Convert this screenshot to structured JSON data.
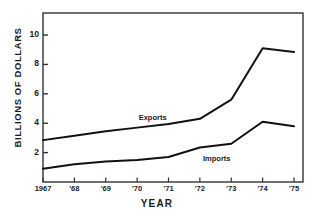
{
  "chart_data": {
    "type": "line",
    "title": "",
    "xlabel": "YEAR",
    "ylabel": "BILLIONS OF DOLLARS",
    "categories": [
      "1967",
      "'68",
      "'69",
      "'70",
      "'71",
      "'72",
      "'73",
      "'74",
      "'75"
    ],
    "x": [
      1967,
      1968,
      1969,
      1970,
      1971,
      1972,
      1973,
      1974,
      1975
    ],
    "xlim": [
      1967,
      1975
    ],
    "ylim": [
      0,
      11.5
    ],
    "yticks": [
      2,
      4,
      6,
      8,
      10
    ],
    "ytick_labels": [
      "2",
      "4",
      "6",
      "8",
      "10"
    ],
    "grid": false,
    "legend": "inline-labels",
    "line_color": "#111111",
    "frame_color": "#333333",
    "background": "#ffffff",
    "series": [
      {
        "name": "Exports",
        "label_x": 1970.05,
        "label_y": 4.35,
        "values": [
          2.85,
          3.15,
          3.45,
          3.7,
          3.95,
          4.3,
          5.6,
          9.1,
          8.85
        ]
      },
      {
        "name": "Imports",
        "label_x": 1972.1,
        "label_y": 1.55,
        "values": [
          0.9,
          1.2,
          1.4,
          1.5,
          1.7,
          2.35,
          2.6,
          4.1,
          3.8
        ]
      }
    ]
  }
}
